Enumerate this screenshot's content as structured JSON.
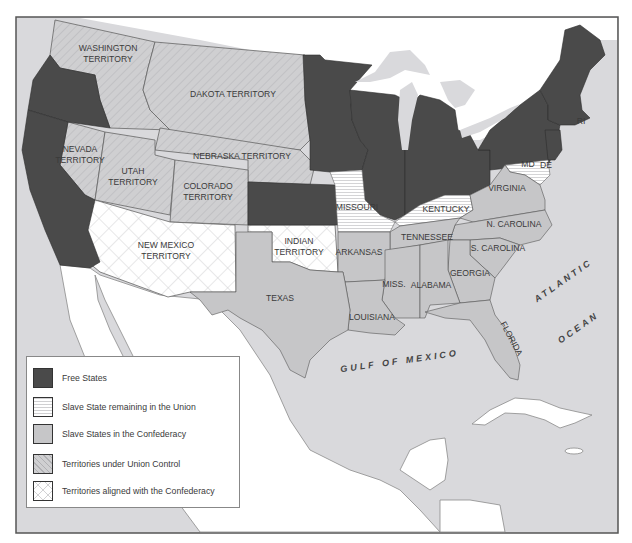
{
  "colors": {
    "free_state": "#4a4a4a",
    "slave_union": "#ffffff",
    "confederacy": "#c6c6c8",
    "territory_union": "#cfcfd1",
    "territory_confederacy": "#ffffff",
    "water": "#d9d9dc",
    "land_foreign": "#ffffff",
    "border": "#555555"
  },
  "legend": {
    "items": [
      {
        "key": "free",
        "label": "Free States"
      },
      {
        "key": "slave_union",
        "label": "Slave State remaining in the Union"
      },
      {
        "key": "confederacy",
        "label": "Slave States in the Confederacy"
      },
      {
        "key": "territory_union",
        "label": "Territories under Union Control"
      },
      {
        "key": "territory_confederacy",
        "label": "Territories aligned with the Confederacy"
      }
    ]
  },
  "regions": {
    "territories_union": [
      "WASHINGTON TERRITORY",
      "DAKOTA TERRITORY",
      "NEBRASKA TERRITORY",
      "NEVADA TERRITORY",
      "UTAH TERRITORY",
      "COLORADO TERRITORY"
    ],
    "territories_confederacy": [
      "NEW MEXICO TERRITORY",
      "INDIAN TERRITORY"
    ],
    "slave_states_union": [
      "MISSOURI",
      "KENTUCKY",
      "MD",
      "DE"
    ],
    "confederate_states": [
      "VIRGINIA",
      "N. CAROLINA",
      "TENNESSEE",
      "S. CAROLINA",
      "ARKANSAS",
      "GEORGIA",
      "MISS.",
      "ALABAMA",
      "TEXAS",
      "LOUISIANA",
      "FLORIDA"
    ],
    "free_states_labeled": [
      "RI"
    ]
  },
  "labels": {
    "washington_1": "WASHINGTON",
    "washington_2": "TERRITORY",
    "dakota": "DAKOTA TERRITORY",
    "nebraska": "NEBRASKA TERRITORY",
    "nevada_1": "NEVADA",
    "nevada_2": "TERRITORY",
    "utah_1": "UTAH",
    "utah_2": "TERRITORY",
    "colorado_1": "COLORADO",
    "colorado_2": "TERRITORY",
    "newmexico_1": "NEW MEXICO",
    "newmexico_2": "TERRITORY",
    "indian_1": "INDIAN",
    "indian_2": "TERRITORY",
    "texas": "TEXAS",
    "missouri": "MISSOURI",
    "kentucky": "KENTUCKY",
    "virginia": "VIRGINIA",
    "ncarolina": "N. CAROLINA",
    "tennessee": "TENNESSEE",
    "scarolina": "S. CAROLINA",
    "arkansas": "ARKANSAS",
    "georgia": "GEORGIA",
    "miss": "MISS.",
    "alabama": "ALABAMA",
    "louisiana": "LOUISIANA",
    "florida": "FLORIDA",
    "md": "MD",
    "de": "DE",
    "ri": "RI",
    "atlantic": "ATLANTIC",
    "ocean": "OCEAN",
    "gulf": "GULF OF MEXICO"
  }
}
